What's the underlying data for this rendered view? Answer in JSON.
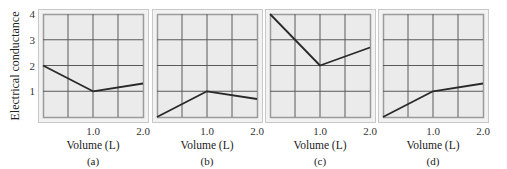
{
  "chart_data": [
    {
      "type": "line",
      "panel_label": "(a)",
      "xlabel": "Volume (L)",
      "ylabel": "Electrical conductance",
      "xlim": [
        0,
        2.0
      ],
      "ylim": [
        0,
        4
      ],
      "xticks": [
        {
          "value": 1.0,
          "label": "1.0"
        },
        {
          "value": 2.0,
          "label": "2.0"
        }
      ],
      "yticks": [
        {
          "value": 1,
          "label": "1"
        },
        {
          "value": 2,
          "label": "2"
        },
        {
          "value": 3,
          "label": "3"
        },
        {
          "value": 4,
          "label": "4"
        }
      ],
      "grid": true,
      "x": [
        0,
        1.0,
        2.0
      ],
      "y": [
        2.0,
        1.0,
        1.3
      ]
    },
    {
      "type": "line",
      "panel_label": "(b)",
      "xlabel": "Volume (L)",
      "xlim": [
        0,
        2.0
      ],
      "ylim": [
        0,
        4
      ],
      "xticks": [
        {
          "value": 1.0,
          "label": "1.0"
        },
        {
          "value": 2.0,
          "label": "2.0"
        }
      ],
      "grid": true,
      "x": [
        0,
        1.0,
        2.0
      ],
      "y": [
        0.0,
        1.0,
        0.7
      ]
    },
    {
      "type": "line",
      "panel_label": "(c)",
      "xlabel": "Volume (L)",
      "xlim": [
        0,
        2.0
      ],
      "ylim": [
        0,
        4
      ],
      "xticks": [
        {
          "value": 1.0,
          "label": "1.0"
        },
        {
          "value": 2.0,
          "label": "2.0"
        }
      ],
      "grid": true,
      "x": [
        0,
        1.0,
        2.0
      ],
      "y": [
        4.0,
        2.0,
        2.7
      ]
    },
    {
      "type": "line",
      "panel_label": "(d)",
      "xlabel": "Volume (L)",
      "xlim": [
        0,
        2.0
      ],
      "ylim": [
        0,
        4
      ],
      "xticks": [
        {
          "value": 1.0,
          "label": "1.0"
        },
        {
          "value": 2.0,
          "label": "2.0"
        }
      ],
      "grid": true,
      "x": [
        0,
        1.0,
        2.0
      ],
      "y": [
        0.0,
        1.0,
        1.3
      ]
    }
  ],
  "colors": {
    "plot_background": "#ebebeb",
    "frame_outer": "#c8c8c8",
    "frame_band": "#f2f2f2",
    "frame_inner": "#9a9a9a",
    "grid": "#5a5a5a",
    "line": "#2a2a2a"
  }
}
